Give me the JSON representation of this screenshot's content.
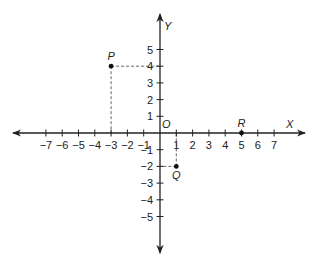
{
  "diagram": {
    "type": "cartesian-coordinate-plane",
    "axes": {
      "x_label": "X",
      "y_label": "Y",
      "origin_label": "O",
      "x_ticks": [
        -7,
        -6,
        -5,
        -4,
        -3,
        -2,
        -1,
        1,
        2,
        3,
        4,
        5,
        6,
        7
      ],
      "y_ticks": [
        -5,
        -4,
        -3,
        -2,
        -1,
        1,
        2,
        3,
        4,
        5
      ],
      "x_tick_labels": [
        "−7",
        "−6",
        "−5",
        "−4",
        "−3",
        "−2",
        "−1",
        "1",
        "2",
        "3",
        "4",
        "5",
        "6",
        "7"
      ],
      "y_tick_labels": [
        "−5",
        "−4",
        "−3",
        "−2",
        "−1",
        "1",
        "2",
        "3",
        "4",
        "5"
      ]
    },
    "points": [
      {
        "label": "P",
        "x": -3,
        "y": 4,
        "projections": true,
        "label_pos": "above"
      },
      {
        "label": "Q",
        "x": 1,
        "y": -2,
        "projections": true,
        "label_pos": "below"
      },
      {
        "label": "R",
        "x": 5,
        "y": 0,
        "projections": false,
        "label_pos": "above"
      }
    ],
    "colors": {
      "line": "#222222",
      "dash": "#555555",
      "text": "#222222"
    }
  }
}
